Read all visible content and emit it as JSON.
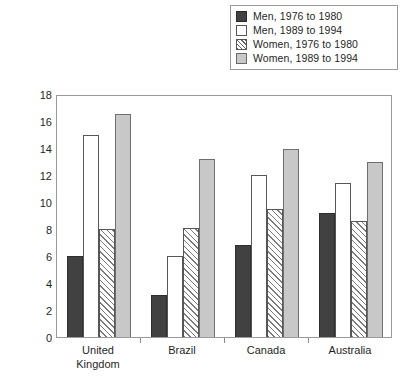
{
  "chart_data": {
    "type": "bar",
    "title": "",
    "xlabel": "",
    "ylabel": "Percentage Obese",
    "ylim": [
      0,
      18
    ],
    "ytick_step": 2,
    "yticks": [
      0,
      2,
      4,
      6,
      8,
      10,
      12,
      14,
      16,
      18
    ],
    "ytick_labels": [
      "0",
      "2",
      "4",
      "6",
      "8",
      "10",
      "12",
      "14",
      "16",
      "18"
    ],
    "grid": false,
    "legend_position": "top-right",
    "categories": [
      "United Kingdom",
      "Brazil",
      "Canada",
      "Australia"
    ],
    "category_labels": [
      "United\nKingdom",
      "Brazil",
      "Canada",
      "Australia"
    ],
    "series": [
      {
        "name": "Men, 1976 to 1980",
        "fill": "solid-dark",
        "color": "#414141",
        "values": [
          6.0,
          3.1,
          6.8,
          9.2
        ]
      },
      {
        "name": "Men, 1989 to 1994",
        "fill": "solid-white",
        "color": "#ffffff",
        "values": [
          15.0,
          6.0,
          12.0,
          11.4
        ]
      },
      {
        "name": "Women, 1976 to 1980",
        "fill": "diagonal-hatch",
        "color": "#ffffff",
        "values": [
          8.0,
          8.1,
          9.5,
          8.6
        ]
      },
      {
        "name": "Women, 1989 to 1994",
        "fill": "solid-gray",
        "color": "#c8c8c8",
        "values": [
          16.5,
          13.2,
          13.9,
          13.0
        ]
      }
    ]
  },
  "legend": {
    "items": [
      {
        "label": "Men, 1976 to 1980",
        "swatch": "solid-dark-swatch"
      },
      {
        "label": "Men, 1989 to 1994",
        "swatch": "solid-white-swatch"
      },
      {
        "label": "Women, 1976 to 1980",
        "swatch": "diagonal-hatch-swatch"
      },
      {
        "label": "Women, 1989 to 1994",
        "swatch": "solid-gray-swatch"
      }
    ]
  },
  "axes": {
    "y_title": "Percentage Obese"
  }
}
